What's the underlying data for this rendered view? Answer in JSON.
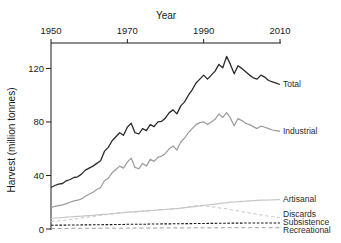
{
  "chart_data": {
    "type": "line",
    "title": "Year",
    "ylabel": "Harvest (million tonnes)",
    "x_axis_position": "top",
    "xlim": [
      1950,
      2010
    ],
    "ylim": [
      0,
      139
    ],
    "x_ticks": [
      1950,
      1970,
      1990,
      2010
    ],
    "y_ticks": [
      0,
      40,
      80,
      120
    ],
    "x_start": 1950,
    "x_step": 1,
    "grid": false,
    "legend_position": "right-end-labels",
    "axis_color": "#1a1a1a",
    "text_color": "#1a1a1a",
    "series": [
      {
        "name": "Total",
        "label": "Total",
        "color": "#2a2a2a",
        "style": "solid",
        "width": 1.3,
        "label_y": 84,
        "values": [
          31,
          32.5,
          33.5,
          34,
          36,
          37,
          38.5,
          39,
          41,
          44,
          45.5,
          47,
          49,
          51,
          58,
          61,
          66,
          69,
          72,
          70,
          76,
          79,
          72,
          71,
          75,
          73.5,
          78,
          76.5,
          80,
          80.5,
          83,
          87,
          89,
          86,
          92,
          95,
          100,
          104,
          109,
          112,
          115,
          112,
          115,
          118,
          123,
          120.5,
          129,
          123,
          116,
          122,
          120,
          117.5,
          115,
          113,
          112,
          115,
          113.5,
          111,
          110,
          109,
          108
        ]
      },
      {
        "name": "Industrial",
        "label": "Industrial",
        "color": "#9b9b9b",
        "style": "solid",
        "width": 1.2,
        "label_y": 131,
        "values": [
          16,
          17,
          17.5,
          18,
          19,
          20,
          21,
          21.5,
          22.5,
          24.5,
          26,
          27.5,
          29.5,
          31,
          36,
          38,
          42,
          44.5,
          47,
          45.5,
          50,
          53,
          46,
          45,
          49,
          47,
          52,
          50.5,
          53.5,
          54.5,
          56.5,
          60,
          62,
          59,
          65,
          68,
          72,
          75,
          78,
          79.5,
          80,
          78,
          80,
          82,
          86,
          83.5,
          87,
          83,
          77,
          82.5,
          81,
          79,
          78,
          76.5,
          75,
          77,
          76,
          75,
          74,
          73.5,
          73
        ]
      },
      {
        "name": "Artisanal",
        "label": "Artisanal",
        "color": "#c6c6c6",
        "style": "solid",
        "width": 1.2,
        "label_y": 199,
        "values": [
          8,
          8.2,
          8.4,
          8.6,
          8.8,
          9,
          9.2,
          9.4,
          9.6,
          9.8,
          10,
          10.2,
          10.5,
          10.7,
          11,
          11.2,
          11.5,
          11.7,
          12,
          12.2,
          12.5,
          12.7,
          13,
          13.2,
          13.4,
          13.6,
          13.8,
          14,
          14.2,
          14.4,
          14.6,
          14.8,
          15,
          15.3,
          15.6,
          16,
          16.3,
          16.6,
          17,
          17.3,
          17.6,
          17.9,
          18.2,
          18.6,
          19,
          19.3,
          19.6,
          20,
          20.2,
          20.4,
          20.6,
          20.8,
          21,
          21.2,
          21.4,
          21.5,
          21.6,
          21.7,
          21.8,
          21.9,
          22
        ]
      },
      {
        "name": "Discards",
        "label": "Discards",
        "color": "#c6c6c6",
        "style": "dashed",
        "dash": "3.5 2.5",
        "width": 1,
        "label_y": 214,
        "values": [
          5.5,
          5.8,
          6.1,
          6.4,
          6.7,
          7,
          7.4,
          7.8,
          8.2,
          8.6,
          9,
          9.4,
          9.8,
          10.2,
          10.6,
          11,
          11.3,
          11.6,
          12,
          12.3,
          12.6,
          13,
          12.7,
          12.9,
          13.2,
          13.4,
          13.7,
          13.9,
          14.2,
          14.4,
          14.6,
          14.9,
          15.2,
          15,
          15.6,
          16,
          16.5,
          17,
          17.3,
          17.5,
          17.3,
          17,
          16.6,
          16.2,
          15.8,
          15.4,
          15,
          14.5,
          14,
          13.5,
          13,
          12.5,
          12,
          11.5,
          11,
          10.5,
          10,
          9.6,
          9.2,
          8.8,
          8.5
        ]
      },
      {
        "name": "Subsistence",
        "label": "Subsistence",
        "color": "#1a1a1a",
        "style": "dashed",
        "dash": "2.6 1.6",
        "width": 1.1,
        "label_y": 222,
        "values": [
          2.8,
          2.8,
          2.9,
          2.9,
          2.9,
          3,
          3,
          3,
          3.1,
          3.1,
          3.1,
          3.2,
          3.2,
          3.2,
          3.3,
          3.3,
          3.3,
          3.4,
          3.4,
          3.4,
          3.5,
          3.5,
          3.5,
          3.6,
          3.6,
          3.6,
          3.7,
          3.7,
          3.7,
          3.8,
          3.8,
          3.8,
          3.9,
          3.9,
          3.9,
          4,
          4,
          4,
          4.1,
          4.1,
          4.1,
          4.2,
          4.2,
          4.2,
          4.3,
          4.3,
          4.3,
          4.4,
          4.4,
          4.4,
          4.4,
          4.5,
          4.5,
          4.5,
          4.5,
          4.5,
          4.5,
          4.5,
          4.5,
          4.5,
          4.5
        ]
      },
      {
        "name": "Recreational",
        "label": "Recreational",
        "color": "#9b9b9b",
        "style": "dashed",
        "dash": "4 2.8",
        "width": 1,
        "label_y": 230,
        "values": [
          0.4,
          0.4,
          0.4,
          0.4,
          0.4,
          0.5,
          0.5,
          0.5,
          0.5,
          0.5,
          0.5,
          0.5,
          0.5,
          0.6,
          0.6,
          0.6,
          0.6,
          0.6,
          0.6,
          0.6,
          0.7,
          0.7,
          0.7,
          0.7,
          0.7,
          0.7,
          0.7,
          0.7,
          0.8,
          0.8,
          0.8,
          0.8,
          0.8,
          0.8,
          0.8,
          0.8,
          0.9,
          0.9,
          0.9,
          0.9,
          0.9,
          0.9,
          0.9,
          0.9,
          0.9,
          1,
          1,
          1,
          1,
          1,
          1,
          1,
          1,
          1,
          1,
          1,
          1,
          1,
          1,
          1,
          1
        ]
      }
    ]
  }
}
